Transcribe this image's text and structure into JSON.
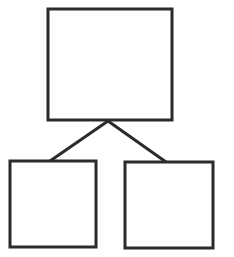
{
  "diagram": {
    "type": "hierarchy-tree",
    "title": "",
    "canvas": {
      "width": 234,
      "height": 257,
      "background": "#ffffff"
    },
    "style": {
      "stroke_color": "#2b2b2b",
      "stroke_width": 3,
      "fill_color": "#ffffff"
    },
    "nodes": [
      {
        "id": "parent",
        "role": "root",
        "label": "",
        "x": 48,
        "y": 9,
        "width": 124,
        "height": 111
      },
      {
        "id": "child-left",
        "role": "leaf",
        "label": "",
        "x": 10,
        "y": 161,
        "width": 86,
        "height": 86
      },
      {
        "id": "child-right",
        "role": "leaf",
        "label": "",
        "x": 125,
        "y": 162,
        "width": 88,
        "height": 86
      }
    ],
    "junction": {
      "x": 108,
      "y": 121
    },
    "edges": [
      {
        "id": "edge-parent-to-left",
        "from": "parent",
        "to": "child-left",
        "x1": 108,
        "y1": 121,
        "x2": 50,
        "y2": 161
      },
      {
        "id": "edge-parent-to-right",
        "from": "parent",
        "to": "child-right",
        "x1": 108,
        "y1": 121,
        "x2": 166,
        "y2": 162
      }
    ]
  }
}
